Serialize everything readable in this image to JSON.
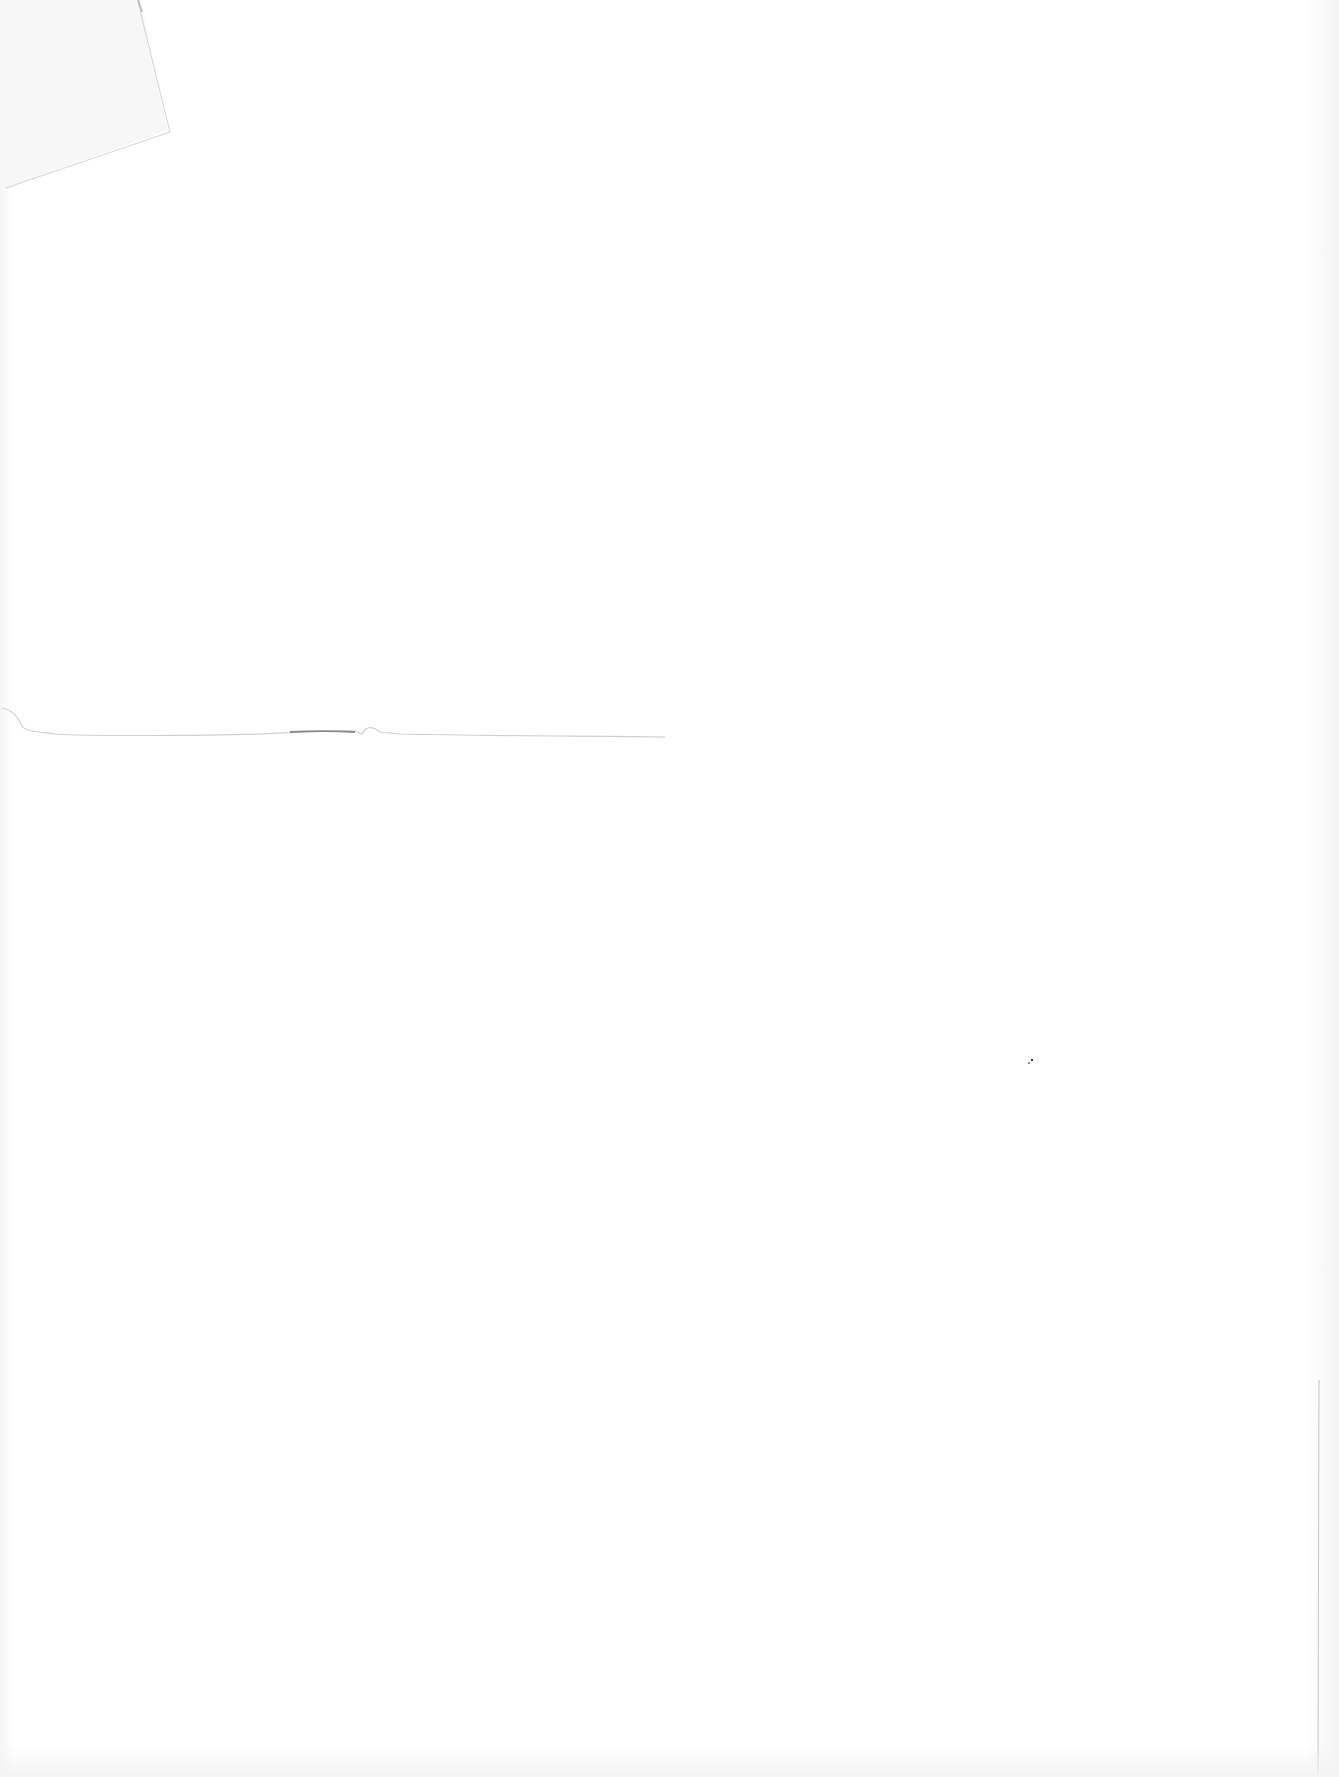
{
  "document": {
    "type": "blank-scanned-page",
    "text_content": []
  }
}
